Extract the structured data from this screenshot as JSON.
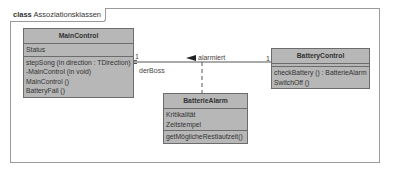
{
  "frame": {
    "keyword": "class",
    "name": "Assoziationsklassen"
  },
  "classes": {
    "main_control": {
      "name": "MainControl",
      "attributes": [
        "Status"
      ],
      "operations": [
        "stepSong (in direction : TDirection)",
        "-MainControl (in void)",
        "MainControl ()",
        "BatteryFail ()"
      ]
    },
    "battery_control": {
      "name": "BatteryControl",
      "attributes": [],
      "operations": [
        "checkBattery () : BatterieAlarm",
        "SwitchOff ()"
      ]
    },
    "batterie_alarm": {
      "name": "BatterieAlarm",
      "attributes": [
        "Kritikalität",
        "Zeitstempel"
      ],
      "operations": [
        "getMöglicheRestlaufzeit()"
      ]
    }
  },
  "association": {
    "name": "alarmiert",
    "role_main": "derBoss",
    "multiplicity_main": "1",
    "multiplicity_battery": "1"
  },
  "colors": {
    "class_fill": "#b7b7b7",
    "class_border": "#6c6c6c",
    "frame_border": "#9a9a9a",
    "line": "#555555"
  }
}
